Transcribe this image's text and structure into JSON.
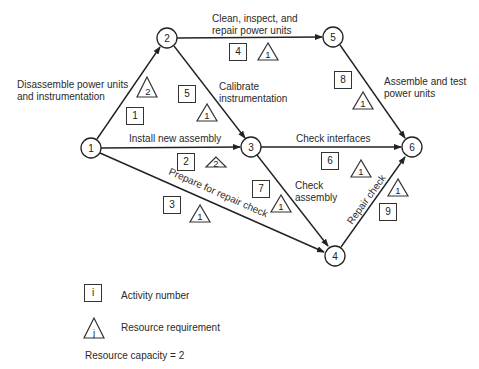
{
  "diagram": {
    "type": "activity-on-arrow network",
    "nodes": [
      {
        "id": "1",
        "x": 91,
        "y": 148
      },
      {
        "id": "2",
        "x": 167,
        "y": 38
      },
      {
        "id": "3",
        "x": 251,
        "y": 147
      },
      {
        "id": "4",
        "x": 335,
        "y": 256
      },
      {
        "id": "5",
        "x": 333,
        "y": 37
      },
      {
        "id": "6",
        "x": 412,
        "y": 147
      }
    ],
    "activities": [
      {
        "number": "1",
        "from": "1",
        "to": "2",
        "label": "Disassemble power units and instrumentation",
        "label_lines": [
          "Disassemble power units",
          "and instrumentation"
        ],
        "resource": "2"
      },
      {
        "number": "2",
        "from": "1",
        "to": "3",
        "label": "Install new assembly",
        "resource": "2"
      },
      {
        "number": "3",
        "from": "1",
        "to": "4",
        "label": "Prepare for repair check",
        "resource": "1"
      },
      {
        "number": "4",
        "from": "2",
        "to": "5",
        "label": "Clean, inspect, and repair power units",
        "label_lines": [
          "Clean, inspect, and",
          "repair power units"
        ],
        "resource": "1"
      },
      {
        "number": "5",
        "from": "2",
        "to": "3",
        "label": "Calibrate instrumentation",
        "label_lines": [
          "Calibrate",
          "instrumentation"
        ],
        "resource": "1"
      },
      {
        "number": "6",
        "from": "3",
        "to": "6",
        "label": "Check interfaces",
        "resource": "1"
      },
      {
        "number": "7",
        "from": "3",
        "to": "4",
        "label": "Check assembly",
        "label_lines": [
          "Check",
          "assembly"
        ],
        "resource": "1"
      },
      {
        "number": "8",
        "from": "5",
        "to": "6",
        "label": "Assemble and test power units",
        "label_lines": [
          "Assemble and test",
          "power units"
        ],
        "resource": "1"
      },
      {
        "number": "9",
        "from": "4",
        "to": "6",
        "label": "Repair check",
        "resource": "1"
      }
    ]
  },
  "legend": {
    "box_symbol": "i",
    "box_label": "Activity number",
    "triangle_symbol": "j",
    "triangle_label": "Resource requirement",
    "capacity_text": "Resource capacity = 2"
  },
  "colors": {
    "line": "#222222",
    "text": "#2a2a2a",
    "background": "#ffffff"
  }
}
